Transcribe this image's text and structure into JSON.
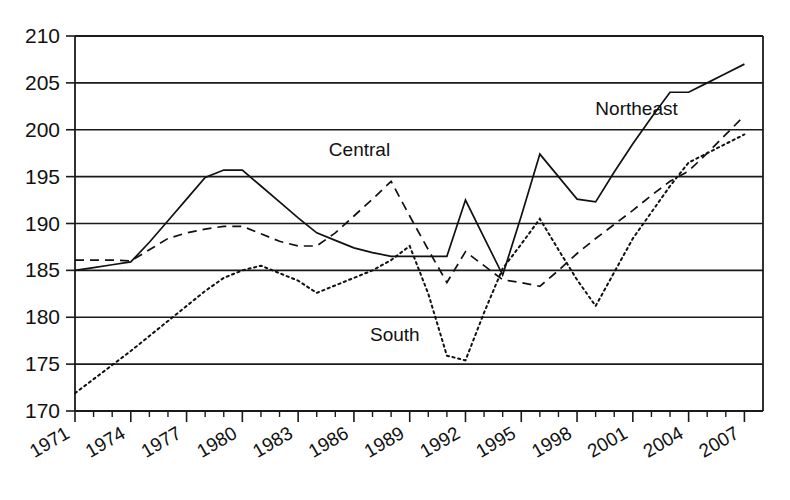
{
  "chart_data": {
    "type": "line",
    "title": "",
    "subtitle": "",
    "xlabel": "",
    "ylabel": "",
    "xlim": [
      1971,
      2008
    ],
    "ylim": [
      170,
      210
    ],
    "grid": true,
    "grid_axis": "y",
    "legend_position": "inline-annotations",
    "y_ticks": [
      170,
      175,
      180,
      185,
      190,
      195,
      200,
      205,
      210
    ],
    "x_ticks": [
      1971,
      1974,
      1977,
      1980,
      1983,
      1986,
      1989,
      1992,
      1995,
      1998,
      2001,
      2004,
      2007
    ],
    "x_tick_labels": [
      "1971",
      "1974",
      "1977",
      "1980",
      "1983",
      "1986",
      "1989",
      "1992",
      "1995",
      "1998",
      "2001",
      "2004",
      "2007"
    ],
    "x_minor_ticks_every": 1,
    "x_tick_label_rotation": -30,
    "x": [
      1971,
      1972,
      1973,
      1974,
      1975,
      1976,
      1977,
      1978,
      1979,
      1980,
      1981,
      1982,
      1983,
      1984,
      1985,
      1986,
      1987,
      1988,
      1989,
      1990,
      1991,
      1992,
      1993,
      1994,
      1995,
      1996,
      1997,
      1998,
      1999,
      2000,
      2001,
      2002,
      2003,
      2004,
      2005,
      2006,
      2007
    ],
    "series": [
      {
        "name": "Northeast",
        "style": "solid",
        "color": "#111111",
        "label_x": 2001.2,
        "label_y": 201.6,
        "values": [
          185.0,
          185.3,
          185.6,
          185.9,
          188.0,
          190.3,
          192.6,
          194.9,
          195.7,
          195.7,
          194.0,
          192.3,
          190.6,
          189.0,
          188.2,
          187.4,
          186.9,
          186.5,
          186.5,
          186.5,
          186.5,
          192.5,
          188.5,
          184.5,
          190.8,
          197.4,
          195.0,
          192.6,
          192.3,
          195.5,
          198.5,
          201.3,
          204.0,
          204.0,
          205.0,
          206.0,
          207.0
        ]
      },
      {
        "name": "Central",
        "style": "dashed",
        "color": "#111111",
        "label_x": 1986.3,
        "label_y": 197.2,
        "values": [
          186.1,
          186.1,
          186.1,
          186.0,
          187.2,
          188.4,
          189.0,
          189.4,
          189.7,
          189.7,
          188.9,
          188.1,
          187.6,
          187.6,
          189.0,
          190.8,
          192.6,
          194.5,
          190.8,
          187.2,
          183.7,
          187.0,
          185.5,
          184.0,
          183.7,
          183.3,
          185.0,
          186.8,
          188.4,
          189.9,
          191.4,
          193.0,
          194.5,
          195.6,
          197.5,
          199.5,
          201.5
        ]
      },
      {
        "name": "South",
        "style": "dotted",
        "color": "#111111",
        "label_x": 1988.2,
        "label_y": 177.5,
        "values": [
          171.9,
          173.4,
          174.9,
          176.4,
          178.0,
          179.6,
          181.2,
          182.8,
          184.2,
          185.0,
          185.5,
          184.7,
          183.9,
          182.6,
          183.4,
          184.2,
          185.0,
          186.1,
          187.6,
          182.5,
          175.9,
          175.4,
          180.5,
          185.2,
          187.8,
          190.5,
          187.2,
          184.0,
          181.2,
          184.8,
          188.4,
          191.2,
          194.0,
          196.5,
          197.5,
          198.5,
          199.5
        ]
      }
    ]
  }
}
